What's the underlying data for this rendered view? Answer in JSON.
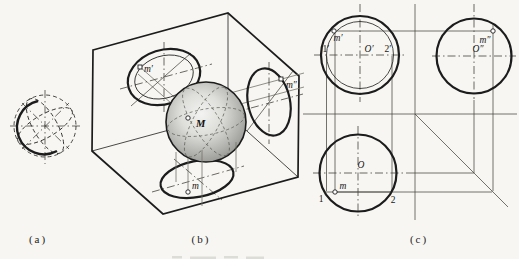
{
  "figure_labels": {
    "a": "(a)",
    "b": "(b)",
    "c": "(c)"
  },
  "panel_b": {
    "sphere_center_label": "M",
    "frontal_point": "m′",
    "profile_point": "m″",
    "horizontal_point": "m"
  },
  "panel_c": {
    "front_view": {
      "center": "O′",
      "point": "m′",
      "left_end": "1′",
      "right_end": "2′"
    },
    "side_view": {
      "center": "O″",
      "point": "m″"
    },
    "top_view": {
      "center": "O",
      "point": "m",
      "left_end": "1",
      "right_end": "2"
    }
  },
  "colors": {
    "ink": "#1c1c1c",
    "construction": "#45453e",
    "projector": "#75746a",
    "paper": "#f7f6f2",
    "sphere_highlight": "#f3f3f1",
    "sphere_shadow": "#8d8d89"
  }
}
